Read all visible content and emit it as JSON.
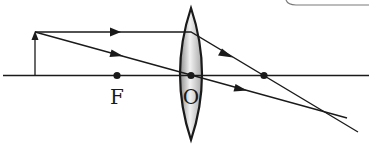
{
  "diagram": {
    "labels": {
      "focus": "F",
      "optical_center": "O"
    },
    "colors": {
      "line": "#1a1a1a",
      "lens_fill_light": "#eeeeee",
      "lens_fill_dark": "#9a9a9a",
      "background": "#ffffff",
      "corner_box_border": "#7a7a7a"
    },
    "elements": {
      "principal_axis": "principal axis",
      "object": "object arrow",
      "lens": "convex lens",
      "focus_left": "focal point F",
      "focus_right": "image-side focal point",
      "ray_parallel": "ray parallel to axis, refracts through focal point",
      "ray_center": "ray through optical center O, passes undeviated"
    }
  }
}
